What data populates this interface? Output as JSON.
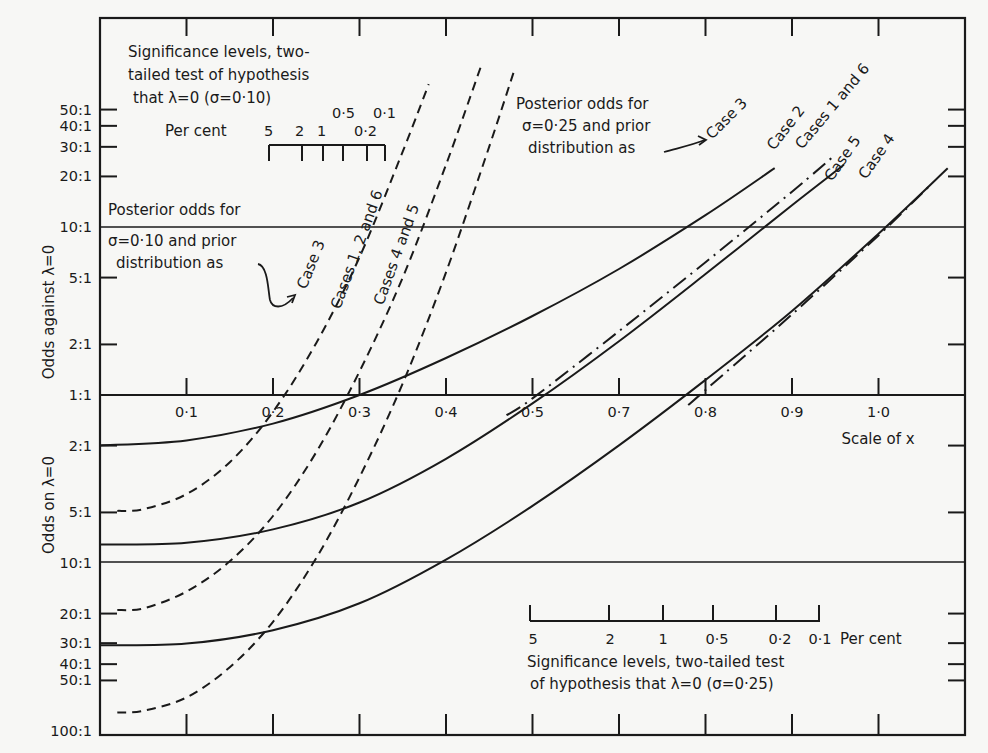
{
  "chart_data": {
    "type": "line",
    "title": "",
    "xlabel": "Scale of x",
    "ylabel_upper": "Odds against λ=0",
    "ylabel_lower": "Odds on λ=0",
    "x_ticks": [
      0.1,
      0.2,
      0.3,
      0.4,
      0.5,
      0.6,
      0.7,
      0.8,
      0.9
    ],
    "x_tick_labels": [
      "0·1",
      "0·2",
      "0·3",
      "0·4",
      "0·5",
      "0·7",
      "0·8",
      "0·9",
      "1·0"
    ],
    "xlim": [
      0,
      1.0
    ],
    "y_scale": "log (odds against positive, odds on negative)",
    "y_upper_ticks": [
      "50:1",
      "40:1",
      "30:1",
      "20:1",
      "10:1",
      "5:1",
      "2:1",
      "1:1"
    ],
    "y_lower_ticks": [
      "2:1",
      "5:1",
      "10:1",
      "20:1",
      "30:1",
      "40:1",
      "50:1",
      "100:1"
    ],
    "y_log10_range": [
      -2,
      2.24
    ],
    "reference_lines_log10": [
      1,
      0,
      -1
    ],
    "series": [
      {
        "name": "Case 3",
        "sigma": 0.25,
        "style": "solid",
        "points": [
          [
            0,
            -0.3
          ],
          [
            0.1,
            -0.27
          ],
          [
            0.2,
            -0.17
          ],
          [
            0.3,
            0.0
          ],
          [
            0.4,
            0.22
          ],
          [
            0.5,
            0.47
          ],
          [
            0.6,
            0.75
          ],
          [
            0.7,
            1.07
          ],
          [
            0.78,
            1.35
          ]
        ]
      },
      {
        "name": "Cases 1 and 6",
        "sigma": 0.25,
        "style": "solid",
        "points": [
          [
            0,
            -0.89
          ],
          [
            0.1,
            -0.88
          ],
          [
            0.2,
            -0.8
          ],
          [
            0.3,
            -0.64
          ],
          [
            0.4,
            -0.38
          ],
          [
            0.5,
            -0.05
          ],
          [
            0.6,
            0.32
          ],
          [
            0.7,
            0.72
          ],
          [
            0.8,
            1.13
          ],
          [
            0.86,
            1.37
          ]
        ]
      },
      {
        "name": "Case 2",
        "sigma": 0.25,
        "style": "dash-dot",
        "points": [
          [
            0.47,
            -0.12
          ],
          [
            0.5,
            -0.02
          ],
          [
            0.6,
            0.38
          ],
          [
            0.7,
            0.79
          ],
          [
            0.8,
            1.21
          ],
          [
            0.85,
            1.43
          ]
        ]
      },
      {
        "name": "Case 4",
        "sigma": 0.25,
        "style": "solid",
        "points": [
          [
            0,
            -1.49
          ],
          [
            0.1,
            -1.48
          ],
          [
            0.2,
            -1.4
          ],
          [
            0.3,
            -1.24
          ],
          [
            0.4,
            -0.98
          ],
          [
            0.5,
            -0.66
          ],
          [
            0.6,
            -0.3
          ],
          [
            0.7,
            0.09
          ],
          [
            0.8,
            0.5
          ],
          [
            0.9,
            0.96
          ],
          [
            0.98,
            1.35
          ]
        ]
      },
      {
        "name": "Case 5",
        "sigma": 0.25,
        "style": "dash-dot",
        "points": [
          [
            0.68,
            -0.06
          ],
          [
            0.7,
            0.03
          ],
          [
            0.8,
            0.48
          ],
          [
            0.9,
            0.95
          ],
          [
            0.96,
            1.25
          ]
        ]
      },
      {
        "name": "Case 3",
        "sigma": 0.1,
        "style": "dashed",
        "points": [
          [
            0.02,
            -0.69
          ],
          [
            0.05,
            -0.68
          ],
          [
            0.1,
            -0.59
          ],
          [
            0.15,
            -0.4
          ],
          [
            0.2,
            -0.1
          ],
          [
            0.25,
            0.31
          ],
          [
            0.3,
            0.82
          ],
          [
            0.35,
            1.45
          ],
          [
            0.38,
            1.85
          ]
        ]
      },
      {
        "name": "Cases 1, 2 and 6",
        "sigma": 0.1,
        "style": "dashed",
        "points": [
          [
            0.02,
            -1.28
          ],
          [
            0.05,
            -1.27
          ],
          [
            0.1,
            -1.17
          ],
          [
            0.15,
            -0.99
          ],
          [
            0.2,
            -0.72
          ],
          [
            0.25,
            -0.34
          ],
          [
            0.3,
            0.14
          ],
          [
            0.35,
            0.7
          ],
          [
            0.4,
            1.37
          ],
          [
            0.44,
            1.95
          ]
        ]
      },
      {
        "name": "Cases 4 and 5",
        "sigma": 0.1,
        "style": "dashed",
        "points": [
          [
            0.02,
            -1.89
          ],
          [
            0.05,
            -1.88
          ],
          [
            0.1,
            -1.8
          ],
          [
            0.15,
            -1.62
          ],
          [
            0.2,
            -1.35
          ],
          [
            0.25,
            -0.97
          ],
          [
            0.3,
            -0.49
          ],
          [
            0.35,
            0.07
          ],
          [
            0.4,
            0.73
          ],
          [
            0.45,
            1.48
          ],
          [
            0.48,
            1.95
          ]
        ]
      }
    ],
    "sig_scale_sigma_010": {
      "title": "Significance levels, two-tailed test of hypothesis that λ=0 (σ=0·10)",
      "unit_label": "Per cent",
      "labels": [
        "5",
        "2",
        "1",
        "0·5",
        "0·2",
        "0·1"
      ]
    },
    "sig_scale_sigma_025": {
      "title": "Significance levels, two-tailed test of hypothesis that λ=0 (σ=0·25)",
      "unit_label": "Per cent",
      "labels": [
        "5",
        "2",
        "1",
        "0·5",
        "0·2",
        "0·1"
      ]
    },
    "annotations": [
      "Posterior odds for σ=0·10 and prior distribution as",
      "Posterior odds for σ=0·25 and prior distribution as"
    ],
    "grid": false,
    "legend_position": "inline labels"
  },
  "labels": {
    "y_upper_title": "Odds against λ=0",
    "y_lower_title": "Odds on λ=0",
    "x_title": "Scale of x",
    "sig010_line1": "Significance levels, two-",
    "sig010_line2": "tailed test of hypothesis",
    "sig010_line3": "that λ=0 (σ=0·10)",
    "sig010_percent": "Per cent",
    "sig010_v5": "5",
    "sig010_v2": "2",
    "sig010_v1": "1",
    "sig010_v05": "0·5",
    "sig010_v01": "0·1",
    "sig010_v02": "0·2",
    "post010_line1": "Posterior odds for",
    "post010_line2": "σ=0·10 and prior",
    "post010_line3": "distribution as",
    "post025_line1": "Posterior odds for",
    "post025_line2": "σ=0·25 and prior",
    "post025_line3": "distribution as",
    "case3_solid": "Case 3",
    "case2_dashdot": "Case 2",
    "cases16_solid": "Cases 1 and 6",
    "case5_dashdot": "Case 5",
    "case4_solid": "Case 4",
    "case3_dashed": "Case 3",
    "cases126_dashed": "Cases 1, 2 and 6",
    "cases45_dashed": "Cases 4 and 5",
    "sig025_values": [
      "5",
      "2",
      "1",
      "0·5",
      "0·2",
      "0·1"
    ],
    "sig025_percent": "Per cent",
    "sig025_line1": "Significance levels, two-tailed test",
    "sig025_line2": "of hypothesis that λ=0 (σ=0·25)"
  }
}
